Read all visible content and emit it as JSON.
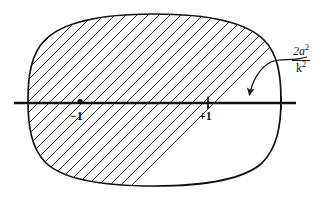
{
  "figure": {
    "background_color": "#ffffff",
    "ink_color": "#111111",
    "width": 336,
    "height": 199
  },
  "region": {
    "name": "hatched-oval",
    "shape": "superellipse-oval",
    "hatching": {
      "style": "diagonal-lines",
      "angle_degrees": 45,
      "spacing_px": 11,
      "line_width": 0.9,
      "count": 23
    },
    "outline": {
      "line_width": 1.6,
      "bounds": {
        "left": 28,
        "top": 14,
        "right": 281,
        "bottom": 186
      }
    }
  },
  "axis": {
    "name": "real-axis",
    "orientation": "horizontal",
    "y": 103,
    "x_start": 14,
    "x_end": 296,
    "line_width": 2.6
  },
  "markers": [
    {
      "name": "point-minus-one",
      "glyph": "dot",
      "label": "−1",
      "x": 80,
      "y": 103,
      "label_x": 70,
      "label_y": 110
    },
    {
      "name": "point-plus-one",
      "glyph": "tick",
      "label": "+1",
      "x": 208,
      "y": 103,
      "label_x": 199,
      "label_y": 110
    },
    {
      "name": "point-right-crossing",
      "glyph": "tick",
      "label": "",
      "x": 281,
      "y": 103
    }
  ],
  "annotation": {
    "name": "radius-annotation",
    "numerator": "2a",
    "numerator_exponent": "2",
    "denominator": "k",
    "denominator_exponent": "2",
    "text_plain": "2a² / k²",
    "label_x": 292,
    "label_y": 45,
    "leader": {
      "style": "curved-with-arrowhead",
      "from_x": 300,
      "from_y": 60,
      "to_x": 249,
      "to_y": 98
    }
  }
}
